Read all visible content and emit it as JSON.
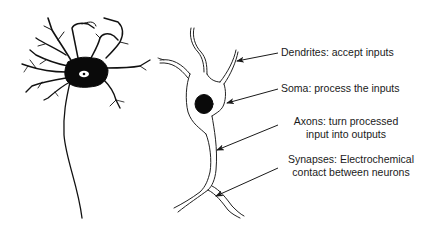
{
  "diagram": {
    "left_figure": {
      "description": "Multipolar neuron with dark soma, branching dendrites and a long axon",
      "parts": [
        "soma",
        "nucleus",
        "dendrites",
        "axon"
      ]
    },
    "right_figure": {
      "description": "Outline drawing of a neuron with labeled parts"
    },
    "annotations": [
      {
        "id": "dendrites",
        "line1": "Dendrites: accept inputs",
        "line2": ""
      },
      {
        "id": "soma",
        "line1": "Soma: process the inputs",
        "line2": ""
      },
      {
        "id": "axons",
        "line1": "Axons: turn processed",
        "line2": "input into outputs"
      },
      {
        "id": "synapses",
        "line1": "Synapses: Electrochemical",
        "line2": "contact between neurons"
      }
    ],
    "colors": {
      "ink": "#1a1a1a",
      "background": "#ffffff"
    }
  }
}
